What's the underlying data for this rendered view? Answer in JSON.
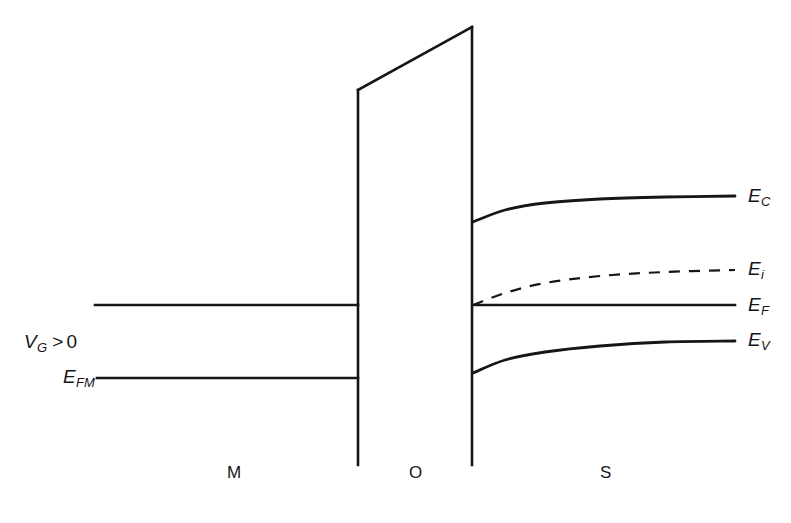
{
  "figure": {
    "background_color": "#ffffff",
    "line_color": "#15151a",
    "width": 791,
    "height": 523
  },
  "labels": {
    "gate_bias": {
      "symbol": "V",
      "subscript": "G",
      "operator": ">",
      "value": "0",
      "full": "V_G > 0"
    },
    "metal_fermi": {
      "symbol": "E",
      "subscript": "FM",
      "full": "E_FM"
    },
    "conduction_band": {
      "symbol": "E",
      "subscript": "C",
      "full": "E_C"
    },
    "intrinsic_level": {
      "symbol": "E",
      "subscript": "i",
      "full": "E_i"
    },
    "fermi_level": {
      "symbol": "E",
      "subscript": "F",
      "full": "E_F"
    },
    "valence_band": {
      "symbol": "E",
      "subscript": "V",
      "full": "E_V"
    }
  },
  "regions": [
    {
      "key": "metal",
      "label": "M",
      "x": 227,
      "y": 463
    },
    {
      "key": "oxide",
      "label": "O",
      "x": 409,
      "y": 463
    },
    {
      "key": "semiconductor",
      "label": "S",
      "x": 600,
      "y": 463
    }
  ],
  "chart_data": {
    "type": "line",
    "xlabel": "",
    "ylabel": "Electron energy",
    "grid": false,
    "legend": "none",
    "note": "Energy increases upward; y pixel values are inverted energy (smaller y = higher energy).",
    "axis_pixel_ranges": {
      "x": [
        0,
        791
      ],
      "y": [
        0,
        523
      ]
    },
    "interfaces": {
      "metal_oxide_x": 358,
      "oxide_semiconductor_x": 472,
      "metal_band_left_x": 95,
      "semiconductor_right_x": 735,
      "oxide_bottom_y": 465
    },
    "series": [
      {
        "name": "Metal conduction edge",
        "region": "metal",
        "style": "solid",
        "points": [
          [
            95,
            305
          ],
          [
            358,
            305
          ]
        ]
      },
      {
        "name": "E_FM",
        "region": "metal",
        "style": "solid",
        "points": [
          [
            97,
            378
          ],
          [
            358,
            378
          ]
        ]
      },
      {
        "name": "Oxide barrier left edge",
        "region": "oxide",
        "style": "solid",
        "points": [
          [
            358,
            90
          ],
          [
            358,
            465
          ]
        ]
      },
      {
        "name": "Oxide barrier top (tilted by field)",
        "region": "oxide",
        "style": "solid",
        "points": [
          [
            358,
            90
          ],
          [
            472,
            27
          ]
        ]
      },
      {
        "name": "Oxide barrier right edge",
        "region": "oxide",
        "style": "solid",
        "points": [
          [
            472,
            27
          ],
          [
            472,
            465
          ]
        ]
      },
      {
        "name": "E_C",
        "region": "semiconductor",
        "style": "solid",
        "bending": "downward toward interface (depletion/inversion)",
        "points": [
          [
            473,
            222
          ],
          [
            505,
            210
          ],
          [
            545,
            203
          ],
          [
            600,
            199
          ],
          [
            665,
            197
          ],
          [
            735,
            196
          ]
        ]
      },
      {
        "name": "E_i",
        "region": "semiconductor",
        "style": "dashed",
        "bending": "downward toward interface, crosses E_F at surface",
        "points": [
          [
            473,
            305
          ],
          [
            505,
            293
          ],
          [
            545,
            283
          ],
          [
            600,
            276
          ],
          [
            665,
            272
          ],
          [
            735,
            270
          ]
        ]
      },
      {
        "name": "E_F",
        "region": "semiconductor",
        "style": "solid",
        "bending": "flat (constant in equilibrium)",
        "points": [
          [
            473,
            305
          ],
          [
            735,
            305
          ]
        ]
      },
      {
        "name": "E_V",
        "region": "semiconductor",
        "style": "solid",
        "bending": "downward toward interface",
        "points": [
          [
            473,
            373
          ],
          [
            505,
            360
          ],
          [
            545,
            352
          ],
          [
            600,
            346
          ],
          [
            665,
            342
          ],
          [
            735,
            341
          ]
        ]
      }
    ]
  }
}
